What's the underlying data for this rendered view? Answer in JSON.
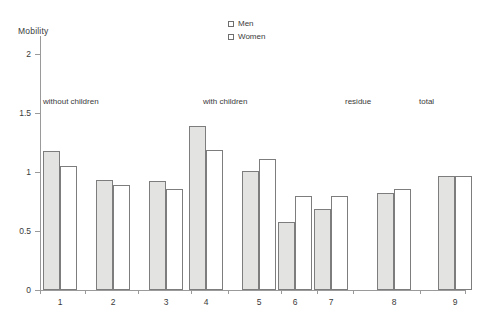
{
  "chart_data": {
    "type": "bar",
    "title": "",
    "ylabel": "Mobility",
    "xlabel": "",
    "ylim": [
      0,
      2.2
    ],
    "grid": false,
    "legend_position": "top-center",
    "categories": [
      "1",
      "2",
      "3",
      "4",
      "5",
      "6",
      "7",
      "8",
      "9"
    ],
    "series": [
      {
        "name": "Men",
        "values": [
          1.18,
          0.93,
          0.92,
          1.39,
          1.01,
          0.58,
          0.69,
          0.82,
          0.97
        ]
      },
      {
        "name": "Women",
        "values": [
          1.05,
          0.89,
          0.86,
          1.19,
          1.11,
          0.8,
          0.8,
          0.86,
          0.97
        ]
      }
    ],
    "y_ticks": [
      "0",
      "0.5",
      "1",
      "1.5",
      "2"
    ],
    "y_tick_values": [
      0,
      0.5,
      1,
      1.5,
      2
    ],
    "annotations": [
      {
        "text": "without children",
        "categories": [
          "1",
          "2",
          "3"
        ]
      },
      {
        "text": "with children",
        "categories": [
          "4",
          "5",
          "6",
          "7"
        ]
      },
      {
        "text": "residue",
        "categories": [
          "8"
        ]
      },
      {
        "text": "total",
        "categories": [
          "9"
        ]
      }
    ],
    "colors": {
      "men": "#e3e3e1",
      "women": "#ffffff",
      "outline": "#7d7d7d",
      "axis": "#9a9a9a",
      "text": "#3a3a3a"
    }
  },
  "axis": {
    "y_title": "Mobility",
    "y_labels": [
      "2",
      "1.5",
      "1",
      "0.5",
      "0"
    ],
    "x_labels": [
      "1",
      "2",
      "3",
      "4",
      "5",
      "6",
      "7",
      "8",
      "9"
    ]
  },
  "groups": [
    {
      "label": "without children"
    },
    {
      "label": "with children"
    },
    {
      "label": "residue"
    },
    {
      "label": "total"
    }
  ],
  "legend": {
    "items": [
      {
        "label": "Men"
      },
      {
        "label": "Women"
      }
    ]
  }
}
